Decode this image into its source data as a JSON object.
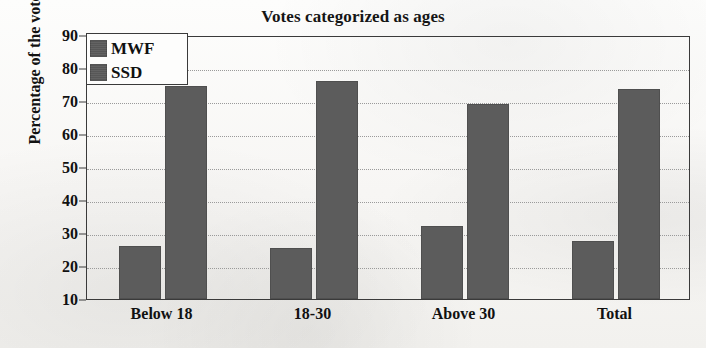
{
  "chart_data": {
    "type": "bar",
    "title": "Votes categorized as ages",
    "xlabel": "",
    "ylabel": "Percentage of the votes (%)",
    "categories": [
      "Below 18",
      "18-30",
      "Above 30",
      "Total"
    ],
    "series": [
      {
        "name": "MWF",
        "values": [
          26,
          25.5,
          32,
          27.5
        ],
        "color": "#5c5c5c"
      },
      {
        "name": "SSD",
        "values": [
          74.5,
          76,
          69,
          73.5
        ],
        "color": "#5c5c5c"
      }
    ],
    "ylim": [
      10,
      90
    ],
    "ytick_step": 10,
    "yticks": [
      90,
      80,
      70,
      60,
      50,
      40,
      30,
      20,
      10
    ],
    "grid": true,
    "grid_axis": "y",
    "legend_position": "upper-left",
    "legend_entries": [
      "MWF",
      "SSD"
    ]
  },
  "legend": {
    "entries": [
      {
        "label": "MWF"
      },
      {
        "label": "SSD"
      }
    ]
  },
  "axes": {
    "y_title": "Percentage of the votes (%)"
  }
}
